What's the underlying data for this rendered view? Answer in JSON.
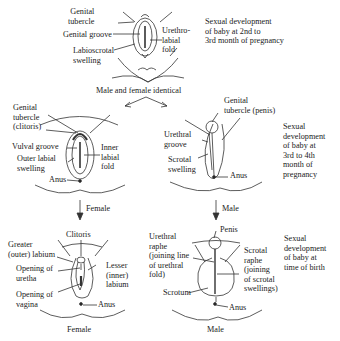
{
  "stage1": {
    "labels": {
      "genital_tubercle": "Genital\ntubercle",
      "genital_groove": "Genital groove",
      "labioscrotal_swelling": "Labioscrotal\nswelling",
      "urethrolabial_fold": "Urethro-\nlabial\nfold"
    },
    "description": "Sexual development\nof baby at 2nd to\n3rd month of pregnancy"
  },
  "split_label": "Male and female identical",
  "stage2_female": {
    "labels": {
      "genital_tubercle": "Genital\ntubercle\n(clitoris)",
      "vulval_groove": "Vulval groove",
      "outer_labial_swelling": "Outer labial\nswelling",
      "inner_labial_fold": "Inner\nlabial\nfold",
      "anus": "Anus"
    }
  },
  "stage2_male": {
    "labels": {
      "genital_tubercle": "Genital\ntubercle (penis)",
      "urethral_groove": "Urethral\ngroove",
      "scrotal_swelling": "Scrotal\nswelling",
      "anus": "Anus"
    },
    "description": "Sexual\ndevelopment\nof baby at\n3rd to 4th\nmonth of\npregnancy"
  },
  "arrows": {
    "female": "Female",
    "male": "Male"
  },
  "stage3_female": {
    "labels": {
      "clitoris": "Clitoris",
      "greater_labium": "Greater\n(outer) labium",
      "opening_urethra": "Opening of\nuretha",
      "opening_vagina": "Opening of\nvagina",
      "lesser_labium": "Lesser\n(inner)\nlabium",
      "anus": "Anus"
    },
    "caption": "Female"
  },
  "stage3_male": {
    "labels": {
      "penis": "Penis",
      "urethral_raphe": "Urethral\nraphe\n(joining line\nof urethral\nfold)",
      "scrotal_raphe": "Scrotal\nraphe\n(joining\nof scrotal\nswellings)",
      "scrotum": "Scrotum",
      "anus": "Anus"
    },
    "caption": "Male",
    "description": "Sexual\ndevelopment\nof baby at\ntime of birth"
  },
  "colors": {
    "line": "#333333",
    "text": "#222222",
    "background": "#ffffff"
  }
}
